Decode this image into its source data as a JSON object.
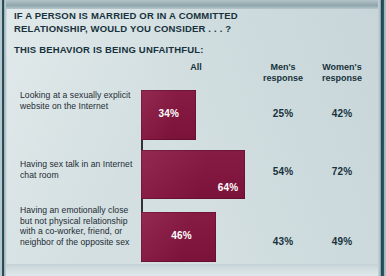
{
  "colors": {
    "bar": "#8a1440",
    "panel_background": "#d3dfe1",
    "frame": "#1e454f",
    "heading_text": "#17323c"
  },
  "heading": {
    "line1": "IF A PERSON IS MARRIED OR IN A COMMITTED",
    "line2": "RELATIONSHIP, WOULD YOU CONSIDER . . . ?",
    "subtitle": "THIS BEHAVIOR IS BEING UNFAITHFUL:"
  },
  "columns": {
    "all": "All",
    "men_line1": "Men's",
    "men_line2": "response",
    "women_line1": "Women's",
    "women_line2": "response"
  },
  "rows": [
    {
      "label": "Looking at a sexually explicit website on the Internet",
      "all": "34%",
      "men": "25%",
      "women": "42%"
    },
    {
      "label": "Having sex talk in an Internet chat room",
      "all": "64%",
      "men": "54%",
      "women": "72%"
    },
    {
      "label": "Having an emotionally close but not physical relationship with a co-worker, friend, or neighbor of the opposite sex",
      "all": "46%",
      "men": "43%",
      "women": "49%"
    }
  ],
  "chart_data": {
    "type": "bar",
    "title": "IF A PERSON IS MARRIED OR IN A COMMITTED RELATIONSHIP, WOULD YOU CONSIDER . . . ? THIS BEHAVIOR IS BEING UNFAITHFUL:",
    "xlabel": "",
    "ylabel": "",
    "xlim": [
      0,
      100
    ],
    "grid": false,
    "orientation": "horizontal",
    "legend": "none",
    "categories": [
      "Looking at a sexually explicit website on the Internet",
      "Having sex talk in an Internet chat room",
      "Having an emotionally close but not physical relationship with a co-worker, friend, or neighbor of the opposite sex"
    ],
    "series": [
      {
        "name": "All",
        "values": [
          34,
          64,
          46
        ],
        "displayed_as": "bar"
      },
      {
        "name": "Men's response",
        "values": [
          25,
          54,
          43
        ],
        "displayed_as": "text"
      },
      {
        "name": "Women's response",
        "values": [
          42,
          72,
          49
        ],
        "displayed_as": "text"
      }
    ],
    "units": "percent",
    "bar_px_per_percent": 1.63
  }
}
